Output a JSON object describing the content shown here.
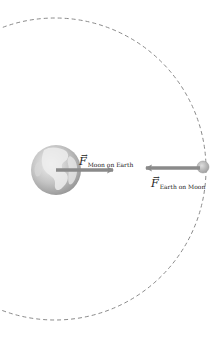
{
  "diagram": {
    "title": "",
    "orbit": {
      "cx": 55,
      "cy": 169,
      "r": 151,
      "stroke": "#8a8a8a",
      "dash": "4 3"
    },
    "earth": {
      "name": "Earth",
      "cx": 56,
      "cy": 170,
      "r": 25,
      "ocean_color": "#bcbcbc",
      "land_color": "#e8e8e8"
    },
    "moon": {
      "name": "Moon",
      "cx": 203,
      "cy": 167,
      "r": 6,
      "color": "#b5b5b5"
    },
    "forces": [
      {
        "id": "force-moon-on-earth",
        "symbol": "F",
        "vector_mark": "→",
        "subscript": "Moon on Earth",
        "x1": 56,
        "y1": 170,
        "x2": 113,
        "y2": 170,
        "color": "#8a8a8a",
        "label_x": 79,
        "label_y": 152
      },
      {
        "id": "force-earth-on-moon",
        "symbol": "F",
        "vector_mark": "→",
        "subscript": "Earth on Moon",
        "x1": 200,
        "y1": 168,
        "x2": 146,
        "y2": 168,
        "color": "#8a8a8a",
        "label_x": 151,
        "label_y": 174
      }
    ]
  }
}
